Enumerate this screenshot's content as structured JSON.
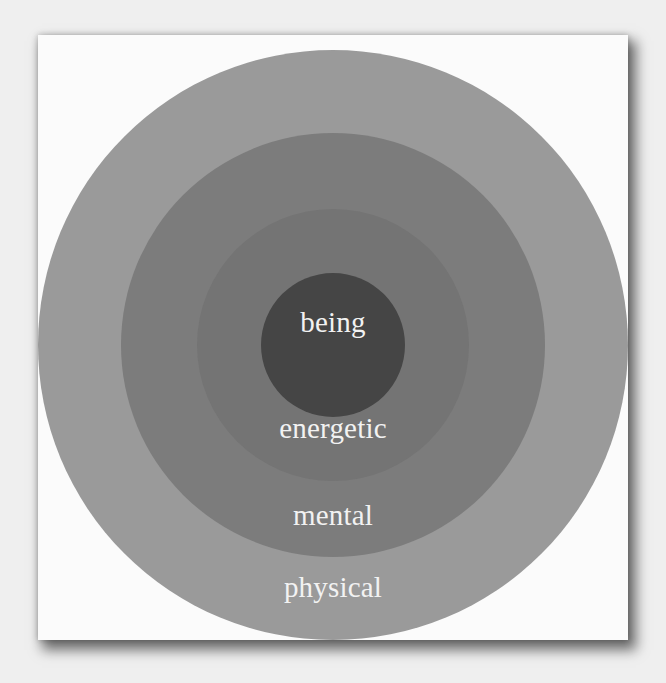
{
  "diagram": {
    "type": "concentric-circles",
    "layers": [
      {
        "label": "physical",
        "color": "#9a9a9a",
        "radius": 295,
        "order": 1
      },
      {
        "label": "mental",
        "color": "#7b7b7b",
        "radius": 212,
        "order": 2
      },
      {
        "label": "energetic",
        "color": "#727272",
        "radius": 136,
        "order": 3
      },
      {
        "label": "being",
        "color": "#444444",
        "radius": 72,
        "order": 4
      }
    ],
    "center": {
      "x": 333,
      "y": 345
    },
    "background_color": "#fbfbfb",
    "label_color": "#f2f2f2"
  }
}
